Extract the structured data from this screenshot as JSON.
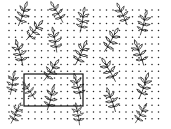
{
  "image": {
    "width": 171,
    "height": 129,
    "background": "#ffffff",
    "description": "Black line-drawing pattern of leafy sprigs scattered over a dotted grid, with a rectangular selection box drawn in the lower-left area"
  },
  "pattern_area": {
    "x": 7,
    "y": 8,
    "width": 156,
    "height": 113
  },
  "dot_grid": {
    "x0": 9,
    "y0": 10,
    "dx": 6.5,
    "dy": 6.8,
    "cols": 24,
    "rows": 17,
    "radius": 0.75,
    "color": "#222222"
  },
  "sprigs": [
    {
      "x": 22,
      "y": 16,
      "angle": 20,
      "scale": 0.85
    },
    {
      "x": 58,
      "y": 14,
      "angle": -30,
      "scale": 0.8
    },
    {
      "x": 82,
      "y": 22,
      "angle": 10,
      "scale": 0.85
    },
    {
      "x": 123,
      "y": 16,
      "angle": -25,
      "scale": 0.8
    },
    {
      "x": 143,
      "y": 25,
      "angle": 15,
      "scale": 0.85
    },
    {
      "x": 33,
      "y": 32,
      "angle": 40,
      "scale": 0.85
    },
    {
      "x": 55,
      "y": 42,
      "angle": -10,
      "scale": 0.85
    },
    {
      "x": 110,
      "y": 42,
      "angle": 30,
      "scale": 0.9
    },
    {
      "x": 20,
      "y": 55,
      "angle": -15,
      "scale": 0.9
    },
    {
      "x": 80,
      "y": 55,
      "angle": 25,
      "scale": 0.9
    },
    {
      "x": 140,
      "y": 55,
      "angle": -20,
      "scale": 0.9
    },
    {
      "x": 50,
      "y": 72,
      "angle": 35,
      "scale": 0.85
    },
    {
      "x": 110,
      "y": 72,
      "angle": -30,
      "scale": 0.9
    },
    {
      "x": 12,
      "y": 85,
      "angle": 10,
      "scale": 0.8
    },
    {
      "x": 78,
      "y": 88,
      "angle": -15,
      "scale": 0.85
    },
    {
      "x": 143,
      "y": 88,
      "angle": 20,
      "scale": 0.9
    },
    {
      "x": 30,
      "y": 92,
      "angle": -35,
      "scale": 0.7
    },
    {
      "x": 50,
      "y": 100,
      "angle": 15,
      "scale": 0.85
    },
    {
      "x": 112,
      "y": 102,
      "angle": -20,
      "scale": 0.85
    },
    {
      "x": 15,
      "y": 115,
      "angle": 25,
      "scale": 0.75
    },
    {
      "x": 78,
      "y": 116,
      "angle": -10,
      "scale": 0.75
    },
    {
      "x": 140,
      "y": 115,
      "angle": 30,
      "scale": 0.75
    }
  ],
  "selection_box": {
    "x": 24,
    "y": 74,
    "width": 59,
    "height": 32,
    "stroke": "#111111",
    "stroke_width": 1.2
  }
}
